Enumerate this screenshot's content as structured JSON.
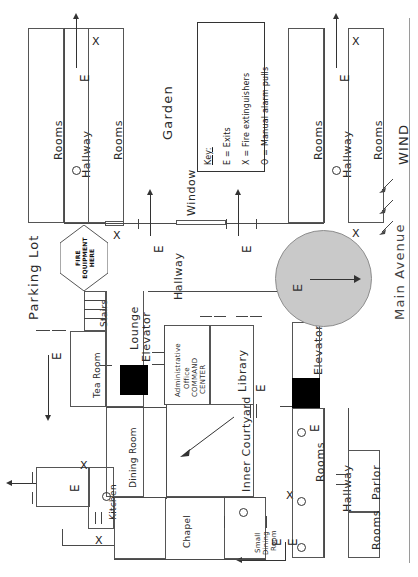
{
  "diagram": {
    "type": "evacuation-floor-plan",
    "orientation_note": "all text rotated 90 degrees counter-clockwise"
  },
  "key": {
    "title": "Key:",
    "entries": [
      {
        "symbol": "E",
        "equals": "=",
        "meaning": "Exits"
      },
      {
        "symbol": "X",
        "equals": "=",
        "meaning": "Fire extinguishers"
      },
      {
        "symbol": "O",
        "equals": "=",
        "meaning": "Manual alarm pulls"
      }
    ]
  },
  "exterior": {
    "parking_lot": "Parking Lot",
    "garden": "Garden",
    "main_avenue": "Main Avenue",
    "wind": "WIND",
    "wind_arrows": 3,
    "window": "Window"
  },
  "assembly": {
    "label": "E",
    "note": "shaded circular assembly / exit discharge area with directional arrow"
  },
  "fire_equipment": {
    "line1": "FIRE",
    "line2": "EQUIPMENT",
    "line3": "HERE"
  },
  "rooms": [
    {
      "id": "rooms-nw-outer",
      "label": "Rooms"
    },
    {
      "id": "hallway-nw",
      "label": "Hallway"
    },
    {
      "id": "rooms-nw-inner",
      "label": "Rooms"
    },
    {
      "id": "rooms-ne-outer",
      "label": "Rooms"
    },
    {
      "id": "hallway-ne",
      "label": "Hallway"
    },
    {
      "id": "rooms-ne-inner",
      "label": "Rooms"
    },
    {
      "id": "hallway-center",
      "label": "Hallway"
    },
    {
      "id": "stairs",
      "label": "Stairs"
    },
    {
      "id": "tea-room",
      "label": "Tea Room"
    },
    {
      "id": "lounge",
      "label": "Lounge"
    },
    {
      "id": "elevator-west",
      "label": "Elevator"
    },
    {
      "id": "elevator-east",
      "label": "Elevator"
    },
    {
      "id": "admin-office",
      "label": "Administrative\nOffice"
    },
    {
      "id": "command-center",
      "label": "COMMAND\nCENTER"
    },
    {
      "id": "library",
      "label": "Library"
    },
    {
      "id": "dining-room",
      "label": "Dining Room"
    },
    {
      "id": "kitchen",
      "label": "Kitchen"
    },
    {
      "id": "chapel",
      "label": "Chapel"
    },
    {
      "id": "inner-courtyard",
      "label": "Inner Courtyard"
    },
    {
      "id": "small-dining-room",
      "label": "Small\nDining\nRoom"
    },
    {
      "id": "rooms-se",
      "label": "Rooms"
    },
    {
      "id": "hallway-se",
      "label": "Hallway"
    },
    {
      "id": "parlor",
      "label": "Parlor"
    },
    {
      "id": "rooms-s",
      "label": "Rooms"
    }
  ],
  "labels": {
    "rooms": "Rooms",
    "hallway": "Hallway",
    "stairs": "Stairs",
    "tea_room": "Tea Room",
    "lounge": "Lounge",
    "elevator": "Elevator",
    "admin_office_l1": "Administrative",
    "admin_office_l2": "Office",
    "command_center_l1": "COMMAND",
    "command_center_l2": "CENTER",
    "library": "Library",
    "dining_room": "Dining Room",
    "kitchen": "Kitchen",
    "chapel": "Chapel",
    "inner_courtyard": "Inner Courtyard",
    "small_dining_l1": "Small",
    "small_dining_l2": "Dining",
    "small_dining_l3": "Room",
    "parlor": "Parlor"
  },
  "markers": {
    "exit": "E",
    "extinguisher": "X",
    "alarm_pull": "O"
  },
  "colors": {
    "ink": "#2a2a2a",
    "wall": "#555555",
    "elevator_fill": "#000000",
    "assembly_zone": "#c9c9c9",
    "assembly_zone_border": "#8d8d8d",
    "paper": "#ffffff"
  }
}
